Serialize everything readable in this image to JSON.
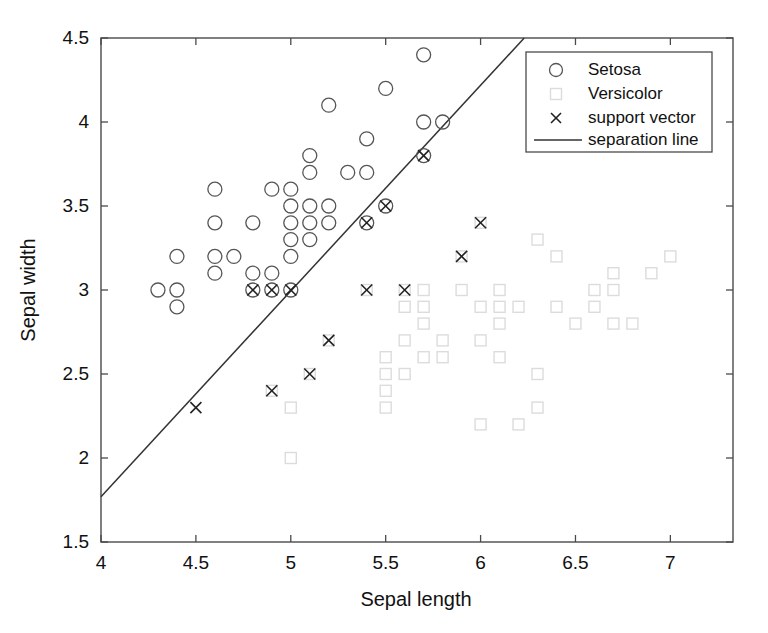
{
  "chart_data": {
    "type": "scatter",
    "title": "",
    "xlabel": "Sepal length",
    "ylabel": "Sepal width",
    "xlim": [
      4,
      7.33
    ],
    "ylim": [
      1.5,
      4.5
    ],
    "xticks": [
      4,
      4.5,
      5,
      5.5,
      6,
      6.5,
      7
    ],
    "xtick_labels": [
      "4",
      "4.5",
      "5",
      "5.5",
      "6",
      "6.5",
      "7"
    ],
    "yticks": [
      1.5,
      2,
      2.5,
      3,
      3.5,
      4,
      4.5
    ],
    "ytick_labels": [
      "1.5",
      "2",
      "2.5",
      "3",
      "3.5",
      "4",
      "4.5"
    ],
    "grid": false,
    "legend_position": "upper right",
    "series": [
      {
        "name": "Setosa",
        "marker": "circle",
        "color": "#555555",
        "points": [
          [
            4.3,
            3.0
          ],
          [
            4.4,
            3.0
          ],
          [
            4.4,
            2.9
          ],
          [
            4.4,
            3.2
          ],
          [
            4.6,
            3.6
          ],
          [
            4.6,
            3.4
          ],
          [
            4.6,
            3.1
          ],
          [
            4.6,
            3.2
          ],
          [
            4.7,
            3.2
          ],
          [
            4.8,
            3.4
          ],
          [
            4.8,
            3.1
          ],
          [
            4.8,
            3.0
          ],
          [
            4.9,
            3.6
          ],
          [
            4.9,
            3.1
          ],
          [
            4.9,
            3.0
          ],
          [
            5.0,
            3.6
          ],
          [
            5.0,
            3.5
          ],
          [
            5.0,
            3.4
          ],
          [
            5.0,
            3.3
          ],
          [
            5.0,
            3.2
          ],
          [
            5.0,
            3.0
          ],
          [
            5.1,
            3.8
          ],
          [
            5.1,
            3.7
          ],
          [
            5.1,
            3.5
          ],
          [
            5.1,
            3.4
          ],
          [
            5.1,
            3.3
          ],
          [
            5.2,
            4.1
          ],
          [
            5.2,
            3.5
          ],
          [
            5.2,
            3.4
          ],
          [
            5.3,
            3.7
          ],
          [
            5.4,
            3.9
          ],
          [
            5.4,
            3.7
          ],
          [
            5.4,
            3.4
          ],
          [
            5.5,
            4.2
          ],
          [
            5.5,
            3.5
          ],
          [
            5.7,
            4.4
          ],
          [
            5.7,
            4.0
          ],
          [
            5.7,
            3.8
          ],
          [
            5.8,
            4.0
          ]
        ]
      },
      {
        "name": "Versicolor",
        "marker": "square",
        "color": "#dcdcdc",
        "points": [
          [
            4.9,
            2.4
          ],
          [
            5.0,
            2.0
          ],
          [
            5.0,
            2.3
          ],
          [
            5.1,
            2.5
          ],
          [
            5.2,
            2.7
          ],
          [
            5.4,
            3.0
          ],
          [
            5.5,
            2.6
          ],
          [
            5.5,
            2.4
          ],
          [
            5.5,
            2.5
          ],
          [
            5.5,
            2.3
          ],
          [
            5.6,
            3.0
          ],
          [
            5.6,
            2.9
          ],
          [
            5.6,
            2.7
          ],
          [
            5.6,
            2.5
          ],
          [
            5.7,
            3.0
          ],
          [
            5.7,
            2.9
          ],
          [
            5.7,
            2.8
          ],
          [
            5.7,
            2.6
          ],
          [
            5.8,
            2.7
          ],
          [
            5.8,
            2.6
          ],
          [
            5.9,
            3.2
          ],
          [
            5.9,
            3.0
          ],
          [
            6.0,
            3.4
          ],
          [
            6.0,
            2.9
          ],
          [
            6.0,
            2.7
          ],
          [
            6.0,
            2.2
          ],
          [
            6.1,
            3.0
          ],
          [
            6.1,
            2.9
          ],
          [
            6.1,
            2.8
          ],
          [
            6.1,
            2.6
          ],
          [
            6.2,
            2.9
          ],
          [
            6.2,
            2.2
          ],
          [
            6.3,
            3.3
          ],
          [
            6.3,
            2.5
          ],
          [
            6.3,
            2.3
          ],
          [
            6.4,
            3.2
          ],
          [
            6.4,
            2.9
          ],
          [
            6.5,
            2.8
          ],
          [
            6.6,
            3.0
          ],
          [
            6.6,
            2.9
          ],
          [
            6.7,
            3.1
          ],
          [
            6.7,
            3.0
          ],
          [
            6.7,
            2.8
          ],
          [
            6.8,
            2.8
          ],
          [
            6.9,
            3.1
          ],
          [
            7.0,
            3.2
          ]
        ]
      },
      {
        "name": "support vector",
        "marker": "x",
        "color": "#222222",
        "points": [
          [
            4.5,
            2.3
          ],
          [
            4.8,
            3.0
          ],
          [
            4.9,
            3.0
          ],
          [
            5.0,
            3.0
          ],
          [
            5.1,
            2.5
          ],
          [
            5.2,
            2.7
          ],
          [
            4.9,
            2.4
          ],
          [
            5.4,
            3.0
          ],
          [
            5.4,
            3.4
          ],
          [
            5.5,
            3.5
          ],
          [
            5.6,
            3.0
          ],
          [
            5.7,
            3.8
          ],
          [
            5.9,
            3.2
          ],
          [
            6.0,
            3.4
          ]
        ]
      }
    ],
    "separation_line": {
      "name": "separation line",
      "color": "#333333",
      "x_start": 4.0,
      "y_start": 1.77,
      "x_end": 6.23,
      "y_end": 4.5
    }
  },
  "legend": {
    "entries": [
      {
        "label": "Setosa",
        "marker": "circle"
      },
      {
        "label": "Versicolor",
        "marker": "square"
      },
      {
        "label": "support vector",
        "marker": "x"
      },
      {
        "label": "separation line",
        "marker": "line"
      }
    ]
  },
  "colors": {
    "axis": "#4a4a4a",
    "setosa": "#555555",
    "versicolor": "#dcdcdc",
    "support_vector": "#222222",
    "separation_line": "#333333",
    "text": "#111111",
    "background": "#ffffff"
  }
}
